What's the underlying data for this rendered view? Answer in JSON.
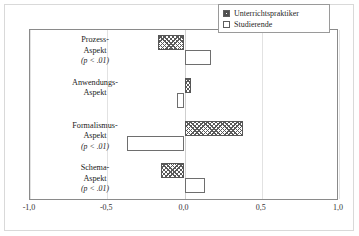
{
  "chart_data": {
    "type": "bar",
    "orientation": "horizontal",
    "title": "",
    "xlabel": "",
    "ylabel": "",
    "xlim": [
      -1.0,
      1.0
    ],
    "xticks": [
      -1.0,
      -0.5,
      0.0,
      0.5,
      1.0
    ],
    "xtick_labels": [
      "-1,0",
      "-0,5",
      "0,0",
      "0,5",
      "1,0"
    ],
    "grid": true,
    "zero_line": true,
    "legend_position": "top-right",
    "categories": [
      "Prozess-Aspekt",
      "Anwendungs-Aspekt",
      "Formalismus-Aspekt",
      "Schema-Aspekt"
    ],
    "series": [
      {
        "name": "Unterrichtspraktiker",
        "fill": "hatched",
        "values": [
          -0.17,
          0.04,
          0.38,
          -0.15
        ]
      },
      {
        "name": "Studierende",
        "fill": "open",
        "values": [
          0.17,
          -0.05,
          -0.37,
          0.13
        ]
      }
    ]
  },
  "legend": {
    "items": [
      {
        "label": "Unterrichtspraktiker",
        "swatch": "hatched-square-icon"
      },
      {
        "label": "Studierende",
        "swatch": "open-square-icon"
      }
    ]
  },
  "categories": [
    {
      "line1": "Prozess-",
      "line2": "Aspekt",
      "pvalue": "(p < .01)",
      "bars": [
        {
          "series": "Unterrichtspraktiker",
          "value": -0.17,
          "fill": "hatched"
        },
        {
          "series": "Studierende",
          "value": 0.17,
          "fill": "open"
        }
      ]
    },
    {
      "line1": "Anwendungs-",
      "line2": "Aspekt",
      "pvalue": "",
      "bars": [
        {
          "series": "Unterrichtspraktiker",
          "value": 0.04,
          "fill": "hatched"
        },
        {
          "series": "Studierende",
          "value": -0.05,
          "fill": "open"
        }
      ]
    },
    {
      "line1": "Formalismus-",
      "line2": "Aspekt",
      "pvalue": "(p < .01)",
      "bars": [
        {
          "series": "Unterrichtspraktiker",
          "value": 0.38,
          "fill": "hatched"
        },
        {
          "series": "Studierende",
          "value": -0.37,
          "fill": "open"
        }
      ]
    },
    {
      "line1": "Schema-",
      "line2": "Aspekt",
      "pvalue": "(p < .01)",
      "bars": [
        {
          "series": "Unterrichtspraktiker",
          "value": -0.15,
          "fill": "hatched"
        },
        {
          "series": "Studierende",
          "value": 0.13,
          "fill": "open"
        }
      ]
    }
  ],
  "xaxis": {
    "ticks": [
      {
        "value": -1.0,
        "label": "-1,0"
      },
      {
        "value": -0.5,
        "label": "-0,5"
      },
      {
        "value": 0.0,
        "label": "0,0"
      },
      {
        "value": 0.5,
        "label": "0,5"
      },
      {
        "value": 1.0,
        "label": "1,0"
      }
    ]
  },
  "colors": {
    "frame": "#8a8a8a",
    "gridline": "#e2e2e2",
    "zero_line": "#cfcfcf",
    "bar_outline": "#6e6e6e",
    "hatch": "#5a5a5a",
    "background": "#ffffff",
    "text": "#1a1a1a"
  }
}
